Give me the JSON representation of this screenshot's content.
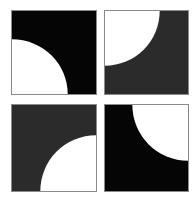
{
  "figure": {
    "tiles": [
      {
        "position": "top-left",
        "fill": "#050505",
        "quarter_circle_corner": "bottom-left",
        "radius_fraction": 0.66
      },
      {
        "position": "top-right",
        "fill": "#2b2b2b",
        "quarter_circle_corner": "top-left",
        "radius_fraction": 0.66
      },
      {
        "position": "bottom-left",
        "fill": "#2b2b2b",
        "quarter_circle_corner": "bottom-right",
        "radius_fraction": 0.66
      },
      {
        "position": "bottom-right",
        "fill": "#050505",
        "quarter_circle_corner": "top-right",
        "radius_fraction": 0.66
      }
    ],
    "circle_color": "#ffffff"
  }
}
